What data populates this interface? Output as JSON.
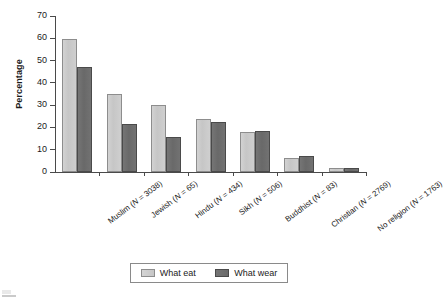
{
  "chart_data": {
    "type": "bar",
    "title": "",
    "xlabel": "",
    "ylabel": "Percentage",
    "ylim": [
      0,
      70
    ],
    "y_ticks": [
      0,
      10,
      20,
      30,
      40,
      50,
      60,
      70
    ],
    "grid": false,
    "legend_position": "bottom",
    "categories": [
      "Muslim (N = 3038)",
      "Jewish (N = 65)",
      "Hindu (N = 434)",
      "Sikh (N = 506)",
      "Buddhist (N = 83)",
      "Christian (N = 2769)",
      "No religion (N = 1763)"
    ],
    "category_parts": [
      {
        "name": "Muslim",
        "n_label": "(N = 3038)",
        "n": 3038
      },
      {
        "name": "Jewish",
        "n_label": "(N = 65)",
        "n": 65
      },
      {
        "name": "Hindu",
        "n_label": "(N = 434)",
        "n": 434
      },
      {
        "name": "Sikh",
        "n_label": "(N = 506)",
        "n": 506
      },
      {
        "name": "Buddhist",
        "n_label": "(N = 83)",
        "n": 83
      },
      {
        "name": "Christian",
        "n_label": "(N = 2769)",
        "n": 2769
      },
      {
        "name": "No religion",
        "n_label": "(N = 1763)",
        "n": 1763
      }
    ],
    "series": [
      {
        "name": "What eat",
        "color": "#c8c8c8",
        "values": [
          59.5,
          35,
          30,
          24,
          18,
          6.5,
          2
        ]
      },
      {
        "name": "What wear",
        "color": "#6e6e6e",
        "values": [
          47,
          21.5,
          15.5,
          22.5,
          18.5,
          7,
          1.8
        ]
      }
    ]
  },
  "legend": {
    "items": [
      {
        "label": "What eat",
        "swatch": "eat"
      },
      {
        "label": "What wear",
        "swatch": "wear"
      }
    ]
  },
  "axis": {
    "y_title": "Percentage",
    "tick_labels": [
      "70",
      "60",
      "50",
      "40",
      "30",
      "20",
      "10",
      "0"
    ]
  },
  "colors": {
    "eat": "#c8c8c8",
    "wear": "#6e6e6e",
    "axis": "#4a4a4a",
    "text": "#1b1b1b",
    "background": "#ffffff"
  }
}
